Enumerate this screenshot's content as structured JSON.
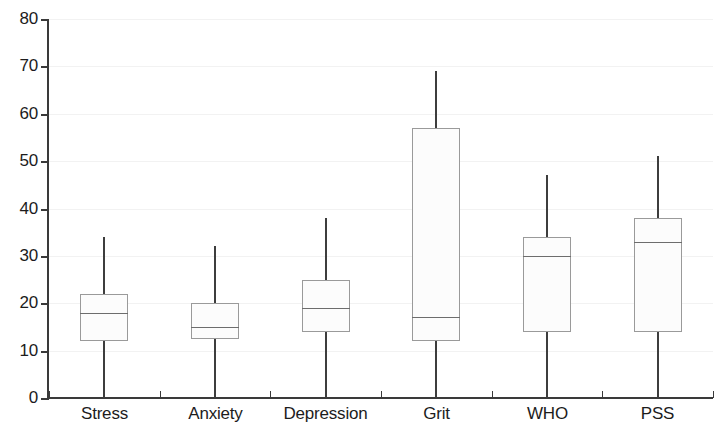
{
  "chart_data": {
    "type": "box",
    "title": "",
    "subtitle": "",
    "xlabel": "",
    "ylabel": "",
    "ylim": [
      0,
      80
    ],
    "ytick_labels": [
      "80",
      "70",
      "60",
      "50",
      "40",
      "30",
      "20",
      "10",
      "0"
    ],
    "ytick_values": [
      80,
      70,
      60,
      50,
      40,
      30,
      20,
      10,
      0
    ],
    "grid": true,
    "grid_axis": "y",
    "legend": false,
    "categories": [
      "Stress",
      "Anxiety",
      "Depression",
      "Grit",
      "WHO",
      "PSS"
    ],
    "boxes": [
      {
        "category": "Stress",
        "min": 0,
        "q1": 12,
        "median": 18,
        "q3": 22,
        "max": 34
      },
      {
        "category": "Anxiety",
        "min": 0,
        "q1": 12.5,
        "median": 15,
        "q3": 20,
        "max": 32
      },
      {
        "category": "Depression",
        "min": 0,
        "q1": 14,
        "median": 19,
        "q3": 25,
        "max": 38
      },
      {
        "category": "Grit",
        "min": 0,
        "q1": 12,
        "median": 17,
        "q3": 57,
        "max": 69
      },
      {
        "category": "WHO",
        "min": 0,
        "q1": 14,
        "median": 30,
        "q3": 34,
        "max": 47
      },
      {
        "category": "PSS",
        "min": 0,
        "q1": 14,
        "median": 33,
        "q3": 38,
        "max": 51
      }
    ],
    "colors": {
      "axis": "#3a3a3a",
      "box_border": "#9a9a9a",
      "box_fill": "#fcfcfc",
      "whisker": "#3d3d3d",
      "median": "#6d6d6d",
      "gridline": "#f2f2f2",
      "text": "#1c1c1c",
      "background": "#ffffff"
    }
  }
}
